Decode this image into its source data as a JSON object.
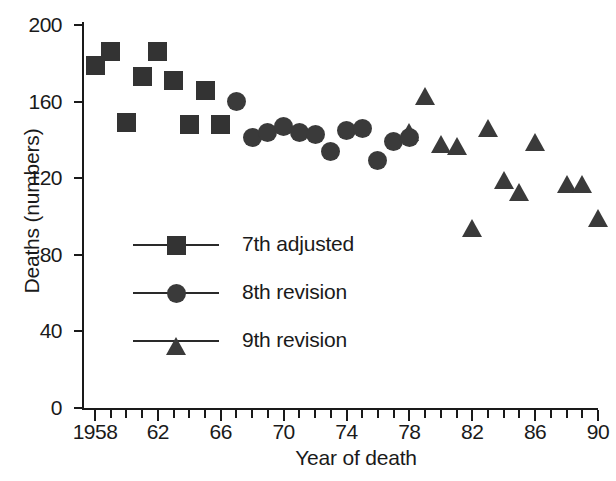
{
  "chart_data": {
    "type": "scatter",
    "title": "",
    "xlabel": "Year of death",
    "ylabel": "Deaths (numbers)",
    "xlim": [
      1958,
      1990
    ],
    "ylim": [
      0,
      200
    ],
    "grid": false,
    "legend_position": "center-left inside axes",
    "y_ticks": [
      0,
      40,
      80,
      120,
      160,
      200
    ],
    "y_tick_labels": [
      "0",
      "40",
      "80",
      "120",
      "160",
      "200"
    ],
    "x_ticks": [
      1958,
      1962,
      1966,
      1970,
      1974,
      1978,
      1982,
      1986,
      1990
    ],
    "x_tick_labels": [
      "1958",
      "62",
      "66",
      "70",
      "74",
      "78",
      "82",
      "86",
      "90"
    ],
    "x_minor_tick_interval": 1,
    "series": [
      {
        "name": "7th adjusted",
        "marker": "square",
        "color": "#333333",
        "points": [
          {
            "x": 1958,
            "y": 179
          },
          {
            "x": 1959,
            "y": 186
          },
          {
            "x": 1960,
            "y": 149
          },
          {
            "x": 1961,
            "y": 173
          },
          {
            "x": 1962,
            "y": 186
          },
          {
            "x": 1963,
            "y": 171
          },
          {
            "x": 1964,
            "y": 148
          },
          {
            "x": 1965,
            "y": 166
          },
          {
            "x": 1966,
            "y": 148
          }
        ]
      },
      {
        "name": "8th revision",
        "marker": "circle",
        "color": "#3a3a3a",
        "points": [
          {
            "x": 1967,
            "y": 160
          },
          {
            "x": 1968,
            "y": 141
          },
          {
            "x": 1969,
            "y": 144
          },
          {
            "x": 1970,
            "y": 147
          },
          {
            "x": 1971,
            "y": 144
          },
          {
            "x": 1972,
            "y": 143
          },
          {
            "x": 1973,
            "y": 134
          },
          {
            "x": 1974,
            "y": 145
          },
          {
            "x": 1975,
            "y": 146
          },
          {
            "x": 1976,
            "y": 129
          },
          {
            "x": 1977,
            "y": 139
          },
          {
            "x": 1978,
            "y": 141
          }
        ]
      },
      {
        "name": "9th revision",
        "marker": "triangle",
        "color": "#3a3a3a",
        "points": [
          {
            "x": 1978,
            "y": 144
          },
          {
            "x": 1979,
            "y": 163
          },
          {
            "x": 1980,
            "y": 138
          },
          {
            "x": 1981,
            "y": 137
          },
          {
            "x": 1982,
            "y": 94
          },
          {
            "x": 1983,
            "y": 146
          },
          {
            "x": 1984,
            "y": 119
          },
          {
            "x": 1985,
            "y": 113
          },
          {
            "x": 1986,
            "y": 139
          },
          {
            "x": 1988,
            "y": 117
          },
          {
            "x": 1989,
            "y": 117
          },
          {
            "x": 1990,
            "y": 99
          }
        ]
      }
    ]
  },
  "legend": {
    "items": [
      {
        "label": "7th adjusted",
        "marker": "square"
      },
      {
        "label": "8th revision",
        "marker": "circle"
      },
      {
        "label": "9th revision",
        "marker": "triangle"
      }
    ]
  }
}
